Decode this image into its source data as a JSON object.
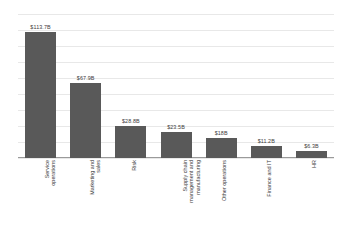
{
  "chart_data": {
    "type": "bar",
    "title": "",
    "subtitle": "",
    "xlabel": "",
    "ylabel": "",
    "ylim": [
      0,
      130
    ],
    "grid": true,
    "legend": false,
    "legend_position": "none",
    "bar_color": "#595959",
    "gridline_color": "#e8e8e8",
    "axis_color": "#9a9a9a",
    "y_tick_labels": [],
    "gridline_values": [
      0,
      14.44,
      28.89,
      43.33,
      57.78,
      72.22,
      86.67,
      101.11,
      115.56,
      130
    ],
    "categories": [
      "Service operations",
      "Marketing and sales",
      "Risk",
      "Supply chain management and manufacturing",
      "Other operations",
      "Finance and IT",
      "HR"
    ],
    "category_lines": [
      [
        "Service",
        "operations"
      ],
      [
        "Marketing and",
        "sales"
      ],
      [
        "Risk"
      ],
      [
        "Supply chain",
        "management and",
        "manufacturing"
      ],
      [
        "Other operations"
      ],
      [
        "Finance and IT"
      ],
      [
        "HR"
      ]
    ],
    "values": [
      113.7,
      67.9,
      28.8,
      23.5,
      18,
      11.2,
      6.3
    ],
    "data_labels": [
      "$113.7B",
      "$67.9B",
      "$28.8B",
      "$23.5B",
      "$18B",
      "$11.2B",
      "$6.3B"
    ],
    "units": "billions of USD"
  }
}
